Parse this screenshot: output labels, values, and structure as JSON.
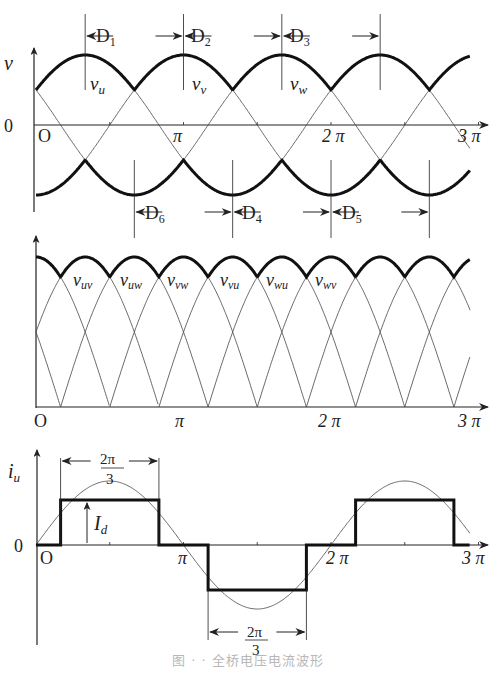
{
  "figure": {
    "caption": "图 · · 全桥电压电流波形",
    "x_axis_labels": {
      "zero": "O",
      "pi": "π",
      "two_pi": "2 π",
      "three_pi": "3 π"
    },
    "colors": {
      "thin": "#444444",
      "bold": "#111111",
      "text": "#222222"
    }
  },
  "panel_phase": {
    "y_label": "v",
    "zero_label": "0",
    "curve_labels": [
      "v_u",
      "v_v",
      "v_w"
    ],
    "curve_labels_main": [
      "v",
      "v",
      "v"
    ],
    "curve_labels_sub": [
      "u",
      "v",
      "w"
    ],
    "upper_diodes": [
      {
        "main": "D",
        "sub": "1"
      },
      {
        "main": "D",
        "sub": "2"
      },
      {
        "main": "D",
        "sub": "3"
      }
    ],
    "lower_diodes": [
      {
        "main": "D",
        "sub": "6"
      },
      {
        "main": "D",
        "sub": "4"
      },
      {
        "main": "D",
        "sub": "5"
      }
    ]
  },
  "panel_line": {
    "curve_labels_main": [
      "v",
      "v",
      "v",
      "v",
      "v",
      "v"
    ],
    "curve_labels_sub": [
      "uv",
      "uw",
      "vw",
      "vu",
      "wu",
      "wv"
    ]
  },
  "panel_current": {
    "y_label_main": "i",
    "y_label_sub": "u",
    "zero_label": "0",
    "dc_label_main": "I",
    "dc_label_sub": "d",
    "width_label_num": "2π",
    "width_label_den": "3"
  },
  "chart_data": [
    {
      "type": "line",
      "title": "Phase voltages and conducting diodes",
      "xlabel": "ωt",
      "ylabel": "v",
      "x_ticks": [
        "0",
        "π",
        "2π",
        "3π"
      ],
      "xlim": [
        0,
        9.4248
      ],
      "series": [
        {
          "name": "v_u",
          "expr": "sin(ωt + π/6)"
        },
        {
          "name": "v_v",
          "expr": "sin(ωt - π/2)"
        },
        {
          "name": "v_w",
          "expr": "sin(ωt + 5π/6)"
        },
        {
          "name": "upper envelope",
          "style": "bold",
          "expr": "max(v_u,v_v,v_w)"
        },
        {
          "name": "lower envelope",
          "style": "bold",
          "expr": "min(v_u,v_v,v_w)"
        }
      ],
      "annotations": [
        {
          "text": "D1",
          "from": "π/3",
          "to": "π"
        },
        {
          "text": "D2",
          "from": "π",
          "to": "5π/3"
        },
        {
          "text": "D3",
          "from": "5π/3",
          "to": "7π/3"
        },
        {
          "text": "D6",
          "from": "2π/3",
          "to": "4π/3"
        },
        {
          "text": "D4",
          "from": "4π/3",
          "to": "2π"
        },
        {
          "text": "D5",
          "from": "2π",
          "to": "8π/3"
        }
      ]
    },
    {
      "type": "line",
      "title": "Rectified line voltages",
      "x_ticks": [
        "0",
        "π",
        "2π",
        "3π"
      ],
      "series": [
        {
          "name": "v_uv"
        },
        {
          "name": "v_uw"
        },
        {
          "name": "v_vw"
        },
        {
          "name": "v_vu"
        },
        {
          "name": "v_wu"
        },
        {
          "name": "v_wv"
        },
        {
          "name": "envelope",
          "style": "bold",
          "expr": "max |v_line|"
        }
      ],
      "notes": "|line voltage| arches of width π, peaks every π/3; envelope ripples between √3/2 and 1 of peak"
    },
    {
      "type": "line",
      "title": "Phase current i_u",
      "ylabel": "i_u",
      "x_ticks": [
        "0",
        "π",
        "2π",
        "3π"
      ],
      "series": [
        {
          "name": "i_u (square)",
          "style": "bold",
          "points": [
            [
              0,
              0
            ],
            [
              0.1667,
              0
            ],
            [
              0.1667,
              1
            ],
            [
              0.8333,
              1
            ],
            [
              0.8333,
              0
            ],
            [
              1.1667,
              0
            ],
            [
              1.1667,
              -1
            ],
            [
              1.8333,
              -1
            ],
            [
              1.8333,
              0
            ],
            [
              2.1667,
              0
            ],
            [
              2.1667,
              1
            ],
            [
              2.8333,
              1
            ],
            [
              2.8333,
              0
            ],
            [
              3,
              0
            ]
          ],
          "x_unit": "π",
          "amplitude": "I_d"
        },
        {
          "name": "fundamental",
          "expr": "sin(ωt)",
          "amplitude_ratio": 1.43
        }
      ],
      "annotations": [
        {
          "text": "2π/3",
          "from": "π/6",
          "to": "5π/6"
        },
        {
          "text": "2π/3",
          "from": "7π/6",
          "to": "11π/6"
        },
        {
          "text": "I_d"
        }
      ]
    }
  ]
}
